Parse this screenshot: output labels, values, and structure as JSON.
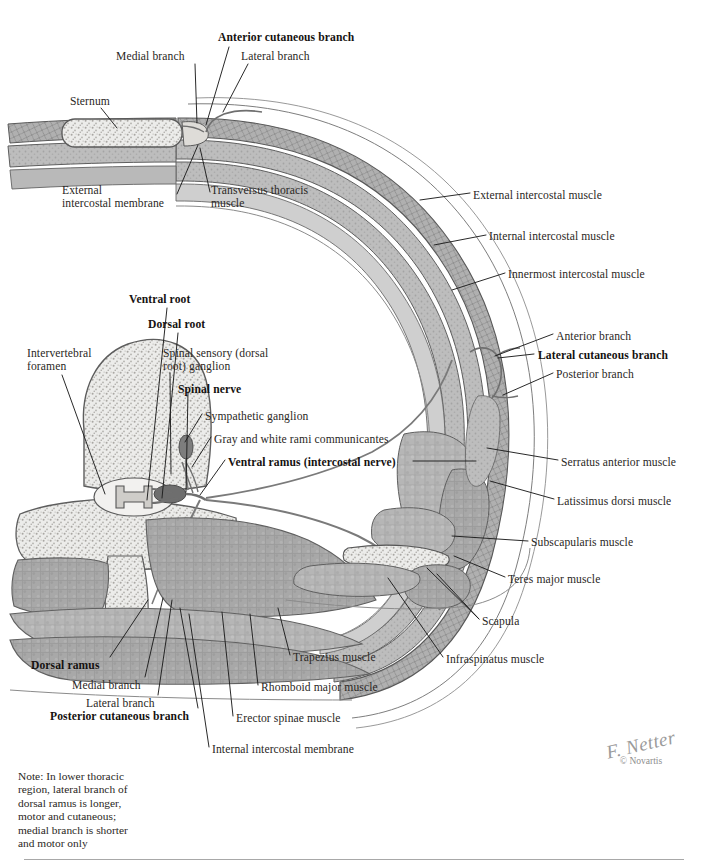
{
  "plate": {
    "title": "Intercostal Nerves and Arteries",
    "note": "Note: In lower thoracic\nregion, lateral branch of\ndorsal ramus is longer,\nmotor and cutaneous;\nmedial branch is shorter\nand motor only",
    "signature_name": "F. Netter",
    "copyright": "© Novartis",
    "colors": {
      "muscle_fill": "#a9a9a9",
      "muscle_fill_light": "#c4c4c4",
      "bone_fill": "#e3e3e1",
      "outline": "#5b5b5b",
      "nerve": "#6f6f6f",
      "leader": "#1d1d1d",
      "text": "#2a2724",
      "rule": "#a8a8a8"
    }
  },
  "labels": [
    {
      "id": "anterior-cutaneous-branch",
      "text": "Anterior cutaneous branch",
      "bold": true,
      "x": 218,
      "y": 32,
      "align": "left"
    },
    {
      "id": "medial-branch-top",
      "text": "Medial branch",
      "bold": false,
      "x": 116,
      "y": 51,
      "align": "left"
    },
    {
      "id": "lateral-branch-top",
      "text": "Lateral branch",
      "bold": false,
      "x": 241,
      "y": 51,
      "align": "left"
    },
    {
      "id": "sternum",
      "text": "Sternum",
      "bold": false,
      "x": 70,
      "y": 96,
      "align": "left"
    },
    {
      "id": "external-intercostal-membrane",
      "text": "External\nintercostal membrane",
      "bold": false,
      "x": 62,
      "y": 185,
      "align": "left"
    },
    {
      "id": "transversus-thoracis-muscle",
      "text": "Transversus thoracis\nmuscle",
      "bold": false,
      "x": 211,
      "y": 185,
      "align": "left"
    },
    {
      "id": "external-intercostal-muscle",
      "text": "External intercostal muscle",
      "bold": false,
      "x": 473,
      "y": 190,
      "align": "left"
    },
    {
      "id": "internal-intercostal-muscle",
      "text": "Internal intercostal muscle",
      "bold": false,
      "x": 489,
      "y": 231,
      "align": "left"
    },
    {
      "id": "innermost-intercostal-muscle",
      "text": "Innermost intercostal muscle",
      "bold": false,
      "x": 508,
      "y": 269,
      "align": "left"
    },
    {
      "id": "ventral-root",
      "text": "Ventral root",
      "bold": true,
      "x": 129,
      "y": 294,
      "align": "left"
    },
    {
      "id": "dorsal-root",
      "text": "Dorsal root",
      "bold": true,
      "x": 148,
      "y": 319,
      "align": "left"
    },
    {
      "id": "anterior-branch",
      "text": "Anterior branch",
      "bold": false,
      "x": 556,
      "y": 331,
      "align": "left"
    },
    {
      "id": "intervertebral-foramen",
      "text": "Intervertebral\nforamen",
      "bold": false,
      "x": 27,
      "y": 348,
      "align": "left"
    },
    {
      "id": "spinal-sensory-ganglion",
      "text": "Spinal sensory (dorsal\nroot) ganglion",
      "bold": false,
      "x": 163,
      "y": 348,
      "align": "left"
    },
    {
      "id": "lateral-cutaneous-branch",
      "text": "Lateral cutaneous branch",
      "bold": true,
      "x": 538,
      "y": 350,
      "align": "left"
    },
    {
      "id": "posterior-branch",
      "text": "Posterior branch",
      "bold": false,
      "x": 556,
      "y": 369,
      "align": "left"
    },
    {
      "id": "spinal-nerve",
      "text": "Spinal nerve",
      "bold": true,
      "x": 178,
      "y": 384,
      "align": "left"
    },
    {
      "id": "sympathetic-ganglion",
      "text": "Sympathetic ganglion",
      "bold": false,
      "x": 205,
      "y": 411,
      "align": "left"
    },
    {
      "id": "gray-white-rami",
      "text": "Gray and white rami communicantes",
      "bold": false,
      "x": 214,
      "y": 434,
      "align": "left"
    },
    {
      "id": "ventral-ramus",
      "text": "Ventral ramus (intercostal nerve)",
      "bold": true,
      "x": 228,
      "y": 457,
      "align": "left"
    },
    {
      "id": "serratus-anterior-muscle",
      "text": "Serratus anterior muscle",
      "bold": false,
      "x": 561,
      "y": 457,
      "align": "left"
    },
    {
      "id": "latissimus-dorsi-muscle",
      "text": "Latissimus dorsi muscle",
      "bold": false,
      "x": 557,
      "y": 496,
      "align": "left"
    },
    {
      "id": "subscapularis-muscle",
      "text": "Subscapularis muscle",
      "bold": false,
      "x": 531,
      "y": 537,
      "align": "left"
    },
    {
      "id": "teres-major-muscle",
      "text": "Teres major muscle",
      "bold": false,
      "x": 508,
      "y": 574,
      "align": "left"
    },
    {
      "id": "scapula",
      "text": "Scapula",
      "bold": false,
      "x": 482,
      "y": 616,
      "align": "left"
    },
    {
      "id": "trapezius-muscle",
      "text": "Trapezius muscle",
      "bold": false,
      "x": 293,
      "y": 652,
      "align": "left"
    },
    {
      "id": "infraspinatus-muscle",
      "text": "Infraspinatus muscle",
      "bold": false,
      "x": 446,
      "y": 654,
      "align": "left"
    },
    {
      "id": "dorsal-ramus",
      "text": "Dorsal ramus",
      "bold": true,
      "x": 31,
      "y": 660,
      "align": "left"
    },
    {
      "id": "rhomboid-major-muscle",
      "text": "Rhomboid major muscle",
      "bold": false,
      "x": 261,
      "y": 682,
      "align": "left"
    },
    {
      "id": "medial-branch-bottom",
      "text": "Medial branch",
      "bold": false,
      "x": 72,
      "y": 680,
      "align": "left"
    },
    {
      "id": "lateral-branch-bottom",
      "text": "Lateral branch",
      "bold": false,
      "x": 86,
      "y": 698,
      "align": "left"
    },
    {
      "id": "erector-spinae-muscle",
      "text": "Erector spinae muscle",
      "bold": false,
      "x": 236,
      "y": 713,
      "align": "left"
    },
    {
      "id": "posterior-cutaneous-branch",
      "text": "Posterior cutaneous branch",
      "bold": true,
      "x": 50,
      "y": 711,
      "align": "left"
    },
    {
      "id": "internal-intercostal-membrane",
      "text": "Internal intercostal membrane",
      "bold": false,
      "x": 212,
      "y": 744,
      "align": "left"
    }
  ],
  "leaders": [
    {
      "id": "leader-anterior-cutaneous-branch",
      "d": "M 229 47 L 206 125"
    },
    {
      "id": "leader-medial-branch-top",
      "d": "M 195 64 L 197 123"
    },
    {
      "id": "leader-lateral-branch-top",
      "d": "M 248 64 L 223 112"
    },
    {
      "id": "leader-sternum",
      "d": "M 101 108 L 117 128"
    },
    {
      "id": "leader-external-intercostal-membrane",
      "d": "M 177 194 L 198 145"
    },
    {
      "id": "leader-transversus-thoracis",
      "d": "M 210 192 L 200 148"
    },
    {
      "id": "leader-external-intercostal-muscle",
      "d": "M 470 193 L 420 200"
    },
    {
      "id": "leader-internal-intercostal-muscle",
      "d": "M 486 235 L 434 245"
    },
    {
      "id": "leader-innermost-intercostal-muscle",
      "d": "M 505 273 L 452 290"
    },
    {
      "id": "leader-ventral-root",
      "d": "M 167 308 L 147 500"
    },
    {
      "id": "leader-dorsal-root",
      "d": "M 178 333 L 162 498"
    },
    {
      "id": "leader-anterior-branch",
      "d": "M 553 334 L 495 356"
    },
    {
      "id": "leader-intervertebral-foramen",
      "d": "M 62 375 L 105 494"
    },
    {
      "id": "leader-spinal-sensory-ganglion",
      "d": "M 170 373 L 171 474"
    },
    {
      "id": "leader-lateral-cutaneous-branch",
      "d": "M 534 354 L 498 358"
    },
    {
      "id": "leader-posterior-branch",
      "d": "M 553 373 L 503 395"
    },
    {
      "id": "leader-spinal-nerve",
      "d": "M 188 392 L 186 492"
    },
    {
      "id": "leader-sympathetic-ganglion",
      "d": "M 202 414 L 185 442"
    },
    {
      "id": "leader-gray-white-rami",
      "d": "M 211 437 L 192 467"
    },
    {
      "id": "leader-ventral-ramus-left",
      "d": "M 225 460 L 200 495"
    },
    {
      "id": "leader-ventral-ramus-right",
      "d": "M 413 461 L 476 461"
    },
    {
      "id": "leader-serratus-anterior",
      "d": "M 558 460 L 487 448"
    },
    {
      "id": "leader-latissimus-dorsi",
      "d": "M 554 499 L 490 481"
    },
    {
      "id": "leader-subscapularis",
      "d": "M 528 541 L 452 536"
    },
    {
      "id": "leader-teres-major",
      "d": "M 505 577 L 454 556"
    },
    {
      "id": "leader-scapula",
      "d": "M 479 619 L 427 568"
    },
    {
      "id": "leader-scapula-2",
      "d": "M 479 619 L 437 574"
    },
    {
      "id": "leader-infraspinatus",
      "d": "M 443 657 L 388 578"
    },
    {
      "id": "leader-trapezius",
      "d": "M 290 655 L 278 608"
    },
    {
      "id": "leader-rhomboid-major",
      "d": "M 258 685 L 250 614"
    },
    {
      "id": "leader-erector-spinae",
      "d": "M 233 716 L 222 612"
    },
    {
      "id": "leader-internal-intercostal-membrane",
      "d": "M 209 747 L 189 614"
    },
    {
      "id": "leader-dorsal-ramus",
      "d": "M 110 657 L 148 600"
    },
    {
      "id": "leader-medial-branch-bottom",
      "d": "M 145 677 L 163 598"
    },
    {
      "id": "leader-lateral-branch-bottom",
      "d": "M 158 695 L 172 600"
    },
    {
      "id": "leader-posterior-cutaneous-branch",
      "d": "M 198 708 L 180 608"
    }
  ]
}
